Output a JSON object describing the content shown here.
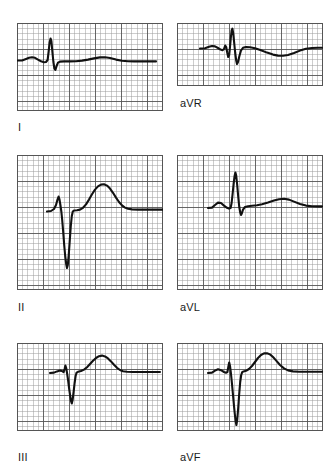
{
  "figure": {
    "type": "ecg-strip-grid",
    "background_color": "#ffffff",
    "trace_color": "#111111",
    "grid_minor_color": "#9a9a9a",
    "grid_major_color": "#555555",
    "grid_minor_px": 5.2,
    "grid_major_every": 5,
    "columns": 2,
    "rows": 3
  },
  "panels": [
    {
      "id": "lead-I",
      "label": "I",
      "label_x": 18,
      "label_y": 122,
      "x": 17,
      "y": 23,
      "width": 146,
      "height": 88,
      "baseline_y": 60,
      "label_position": "below-left",
      "morphology": {
        "p_wave": "small upright",
        "qrs": "small narrow R, tiny s",
        "t_wave": "low broad upright",
        "description": "Lead I: low voltage complex, small R wave, flat ST, low rounded T wave"
      },
      "trace": [
        [
          17,
          60.5
        ],
        [
          22,
          60.5
        ],
        [
          26,
          59.0
        ],
        [
          29,
          57.8
        ],
        [
          32,
          57.2
        ],
        [
          35,
          57.8
        ],
        [
          38,
          59.6
        ],
        [
          41,
          61.2
        ],
        [
          44,
          62.2
        ],
        [
          46,
          62.0
        ],
        [
          47.6,
          60.0
        ],
        [
          48.6,
          52.0
        ],
        [
          49.6,
          42.5
        ],
        [
          50.6,
          38.5
        ],
        [
          51.4,
          41.0
        ],
        [
          52.4,
          52.0
        ],
        [
          53.4,
          62.0
        ],
        [
          54.4,
          68.5
        ],
        [
          55.4,
          70.0
        ],
        [
          56.6,
          66.0
        ],
        [
          58.0,
          62.6
        ],
        [
          60.0,
          61.6
        ],
        [
          64,
          61.4
        ],
        [
          70,
          61.4
        ],
        [
          76,
          61.2
        ],
        [
          82,
          60.6
        ],
        [
          88,
          59.6
        ],
        [
          94,
          58.4
        ],
        [
          100,
          57.4
        ],
        [
          105,
          57.2
        ],
        [
          110,
          58.0
        ],
        [
          116,
          59.6
        ],
        [
          122,
          60.8
        ],
        [
          128,
          61.3
        ],
        [
          134,
          61.4
        ],
        [
          140,
          61.4
        ],
        [
          146,
          61.4
        ],
        [
          152,
          61.4
        ],
        [
          156,
          61.4
        ]
      ]
    },
    {
      "id": "lead-aVR",
      "label": "aVR",
      "label_x": 180,
      "label_y": 98,
      "x": 177,
      "y": 23,
      "width": 146,
      "height": 63,
      "baseline_y": 48,
      "label_position": "below-left",
      "morphology": {
        "p_wave": "small notched",
        "qrs": "small q, tall narrow R, deep S",
        "t_wave": "broad inverted",
        "description": "aVR: small q, sharp tall R with deep S, broad negative T wave"
      },
      "trace": [
        [
          200,
          48.5
        ],
        [
          205,
          48.2
        ],
        [
          209,
          46.8
        ],
        [
          212,
          46.0
        ],
        [
          215,
          46.4
        ],
        [
          218,
          48.0
        ],
        [
          220.5,
          49.6
        ],
        [
          222.5,
          50.2
        ],
        [
          224,
          49.0
        ],
        [
          225.2,
          45.5
        ],
        [
          226.2,
          47.0
        ],
        [
          227.2,
          52.5
        ],
        [
          228.2,
          57.0
        ],
        [
          229.2,
          55.0
        ],
        [
          230.0,
          47.0
        ],
        [
          230.8,
          38.0
        ],
        [
          231.6,
          30.5
        ],
        [
          232.4,
          28.6
        ],
        [
          233.2,
          33.0
        ],
        [
          234.2,
          43.0
        ],
        [
          235.2,
          53.0
        ],
        [
          236.2,
          60.5
        ],
        [
          237.0,
          64.0
        ],
        [
          238.0,
          62.0
        ],
        [
          239.4,
          56.0
        ],
        [
          241.0,
          50.5
        ],
        [
          243.0,
          47.8
        ],
        [
          246,
          47.0
        ],
        [
          250,
          47.2
        ],
        [
          255,
          48.2
        ],
        [
          261,
          50.2
        ],
        [
          267,
          52.6
        ],
        [
          273,
          54.6
        ],
        [
          278,
          55.6
        ],
        [
          283,
          55.8
        ],
        [
          288,
          55.0
        ],
        [
          294,
          53.0
        ],
        [
          300,
          50.6
        ],
        [
          306,
          48.8
        ],
        [
          312,
          48.0
        ],
        [
          318,
          47.8
        ],
        [
          322,
          47.8
        ]
      ]
    },
    {
      "id": "lead-II",
      "label": "II",
      "label_x": 18,
      "label_y": 302,
      "x": 17,
      "y": 155,
      "width": 146,
      "height": 135,
      "baseline_y": 210,
      "label_position": "below-left",
      "morphology": {
        "p_wave": "upright peaked",
        "qrs": "narrow tall-ish R then very deep S",
        "t_wave": "tall broad upright",
        "description": "Lead II: peaked P, narrow R, very deep S wave, tall rounded T wave"
      },
      "trace": [
        [
          47,
          211.5
        ],
        [
          51,
          211.0
        ],
        [
          54,
          209.0
        ],
        [
          56,
          205.0
        ],
        [
          57.5,
          199.5
        ],
        [
          58.6,
          196.5
        ],
        [
          59.4,
          199.0
        ],
        [
          60.4,
          205.0
        ],
        [
          61.4,
          212.0
        ],
        [
          62.2,
          220.0
        ],
        [
          63.2,
          232.0
        ],
        [
          64.2,
          245.0
        ],
        [
          65.2,
          256.0
        ],
        [
          66.2,
          264.0
        ],
        [
          67.0,
          268.0
        ],
        [
          67.8,
          265.0
        ],
        [
          68.8,
          254.0
        ],
        [
          69.8,
          240.0
        ],
        [
          70.8,
          226.0
        ],
        [
          71.8,
          216.0
        ],
        [
          72.8,
          211.5
        ],
        [
          74.0,
          210.5
        ],
        [
          77,
          210.2
        ],
        [
          80,
          209.6
        ],
        [
          83,
          207.8
        ],
        [
          86,
          204.4
        ],
        [
          89,
          199.6
        ],
        [
          92,
          194.2
        ],
        [
          95,
          189.6
        ],
        [
          98,
          186.4
        ],
        [
          101,
          184.6
        ],
        [
          104,
          184.2
        ],
        [
          107,
          185.6
        ],
        [
          110,
          188.6
        ],
        [
          113,
          192.8
        ],
        [
          116,
          197.6
        ],
        [
          119,
          202.0
        ],
        [
          122,
          205.4
        ],
        [
          125,
          207.6
        ],
        [
          128,
          208.8
        ],
        [
          132,
          209.4
        ],
        [
          138,
          209.6
        ],
        [
          145,
          209.6
        ],
        [
          152,
          209.6
        ],
        [
          158,
          209.6
        ],
        [
          163,
          209.6
        ]
      ]
    },
    {
      "id": "lead-aVL",
      "label": "aVL",
      "label_x": 180,
      "label_y": 302,
      "x": 177,
      "y": 155,
      "width": 146,
      "height": 135,
      "baseline_y": 207,
      "label_position": "below-left",
      "morphology": {
        "p_wave": "small upright notched",
        "qrs": "tall narrow R with small s",
        "t_wave": "low broad upright",
        "description": "aVL: small P, tall narrow R wave, small s, low rounded T wave"
      },
      "trace": [
        [
          208,
          208.0
        ],
        [
          212,
          207.6
        ],
        [
          215,
          205.0
        ],
        [
          218,
          202.6
        ],
        [
          221,
          203.0
        ],
        [
          224,
          205.6
        ],
        [
          227,
          207.8
        ],
        [
          229,
          208.6
        ],
        [
          230.6,
          208.0
        ],
        [
          231.6,
          203.0
        ],
        [
          232.6,
          194.0
        ],
        [
          233.6,
          184.0
        ],
        [
          234.6,
          176.0
        ],
        [
          235.4,
          172.5
        ],
        [
          236.2,
          175.5
        ],
        [
          237.2,
          185.0
        ],
        [
          238.2,
          196.5
        ],
        [
          239.2,
          206.5
        ],
        [
          240.2,
          212.5
        ],
        [
          241.0,
          215.0
        ],
        [
          241.8,
          213.5
        ],
        [
          243.0,
          209.6
        ],
        [
          245.0,
          207.0
        ],
        [
          248,
          206.2
        ],
        [
          252,
          205.8
        ],
        [
          257,
          205.2
        ],
        [
          262,
          204.2
        ],
        [
          268,
          202.6
        ],
        [
          274,
          200.6
        ],
        [
          279,
          199.2
        ],
        [
          284,
          198.8
        ],
        [
          289,
          199.6
        ],
        [
          294,
          201.6
        ],
        [
          300,
          204.0
        ],
        [
          306,
          205.6
        ],
        [
          312,
          206.2
        ],
        [
          318,
          206.4
        ],
        [
          322,
          206.4
        ]
      ]
    },
    {
      "id": "lead-III",
      "label": "III",
      "label_x": 18,
      "label_y": 452,
      "x": 17,
      "y": 343,
      "width": 146,
      "height": 88,
      "baseline_y": 372,
      "label_position": "below-left",
      "morphology": {
        "p_wave": "flat small",
        "qrs": "tiny r, deep narrow S",
        "t_wave": "tall rounded upright",
        "description": "Lead III: flat P, tiny r with deep S wave, tall rounded T wave"
      },
      "trace": [
        [
          50,
          373.0
        ],
        [
          54,
          372.6
        ],
        [
          57,
          371.4
        ],
        [
          60,
          370.6
        ],
        [
          62,
          371.0
        ],
        [
          63.6,
          372.2
        ],
        [
          64.6,
          369.0
        ],
        [
          65.4,
          365.5
        ],
        [
          66.2,
          368.0
        ],
        [
          67.2,
          374.0
        ],
        [
          68.2,
          381.0
        ],
        [
          69.2,
          389.0
        ],
        [
          70.2,
          396.0
        ],
        [
          71.0,
          401.0
        ],
        [
          71.8,
          403.5
        ],
        [
          72.6,
          400.0
        ],
        [
          73.6,
          392.0
        ],
        [
          74.6,
          383.0
        ],
        [
          75.6,
          376.0
        ],
        [
          76.6,
          372.6
        ],
        [
          78.0,
          371.8
        ],
        [
          81,
          371.0
        ],
        [
          84,
          369.6
        ],
        [
          87,
          367.2
        ],
        [
          90,
          364.0
        ],
        [
          93,
          360.8
        ],
        [
          96,
          358.0
        ],
        [
          99,
          356.2
        ],
        [
          102,
          355.6
        ],
        [
          105,
          356.4
        ],
        [
          108,
          358.4
        ],
        [
          111,
          361.4
        ],
        [
          114,
          364.8
        ],
        [
          117,
          367.8
        ],
        [
          120,
          370.0
        ],
        [
          123,
          371.2
        ],
        [
          127,
          371.8
        ],
        [
          133,
          372.0
        ],
        [
          140,
          372.0
        ],
        [
          148,
          372.0
        ],
        [
          155,
          372.0
        ],
        [
          160,
          372.0
        ]
      ]
    },
    {
      "id": "lead-aVF",
      "label": "aVF",
      "label_x": 180,
      "label_y": 452,
      "x": 177,
      "y": 343,
      "width": 146,
      "height": 88,
      "baseline_y": 372,
      "label_position": "below-left",
      "morphology": {
        "p_wave": "small upright",
        "qrs": "narrow r then very deep S",
        "t_wave": "tall broad upright",
        "description": "aVF: small P, narrow r with very deep S extending below panel, tall rounded T wave"
      },
      "trace": [
        [
          208,
          373.0
        ],
        [
          212,
          372.6
        ],
        [
          215,
          370.6
        ],
        [
          218,
          369.2
        ],
        [
          221,
          370.2
        ],
        [
          224,
          372.0
        ],
        [
          226,
          372.8
        ],
        [
          227.4,
          372.0
        ],
        [
          228.4,
          366.5
        ],
        [
          229.2,
          362.5
        ],
        [
          230.0,
          366.0
        ],
        [
          231.0,
          374.0
        ],
        [
          232.0,
          384.0
        ],
        [
          233.0,
          395.0
        ],
        [
          234.0,
          406.0
        ],
        [
          234.8,
          414.0
        ],
        [
          235.6,
          421.0
        ],
        [
          236.4,
          425.0
        ],
        [
          237.2,
          420.0
        ],
        [
          238.2,
          408.0
        ],
        [
          239.2,
          394.0
        ],
        [
          240.2,
          382.0
        ],
        [
          241.2,
          375.0
        ],
        [
          242.2,
          372.2
        ],
        [
          243.6,
          371.4
        ],
        [
          246,
          370.8
        ],
        [
          249,
          369.0
        ],
        [
          252,
          366.0
        ],
        [
          255,
          362.0
        ],
        [
          258,
          358.0
        ],
        [
          261,
          355.0
        ],
        [
          264,
          353.4
        ],
        [
          267,
          353.2
        ],
        [
          270,
          354.4
        ],
        [
          273,
          357.0
        ],
        [
          276,
          360.4
        ],
        [
          280,
          365.0
        ],
        [
          284,
          368.4
        ],
        [
          288,
          370.4
        ],
        [
          293,
          371.4
        ],
        [
          299,
          371.8
        ],
        [
          306,
          371.8
        ],
        [
          313,
          371.8
        ],
        [
          320,
          371.8
        ],
        [
          323,
          371.8
        ]
      ]
    }
  ]
}
